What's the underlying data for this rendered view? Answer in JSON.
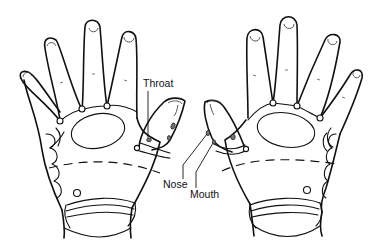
{
  "figure": {
    "colors": {
      "line": "#111111",
      "background": "#ffffff",
      "reflex_point_fill": "#777777"
    },
    "labels": {
      "throat": "Throat",
      "nose": "Nose",
      "mouth": "Mouth"
    },
    "hands": [
      {
        "side": "left",
        "view": "palm",
        "fingers": 5
      },
      {
        "side": "right",
        "view": "palm",
        "fingers": 5
      }
    ]
  }
}
